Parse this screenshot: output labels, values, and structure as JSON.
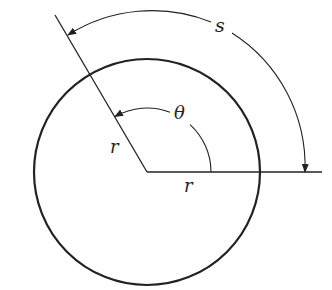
{
  "diagram": {
    "labels": {
      "arc_length": "s",
      "angle": "θ",
      "radius_slanted": "r",
      "radius_horizontal": "r"
    },
    "geometry": {
      "center": [
        147,
        172
      ],
      "circle_radius": 113,
      "angle_degrees": 120,
      "theta_arc_radius": 64,
      "s_arc_radius": 158
    },
    "colors": {
      "stroke": "#222222",
      "background": "#ffffff"
    }
  }
}
